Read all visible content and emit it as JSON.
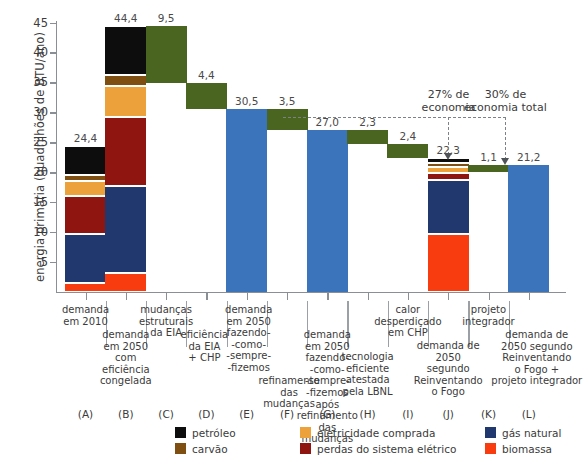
{
  "chart_data": {
    "type": "bar",
    "title": "",
    "xlabel": "",
    "ylabel": "energia primária (quadrilhões de BTU/ano)",
    "ylim": [
      0,
      45
    ],
    "yticks": [
      5,
      10,
      15,
      20,
      25,
      30,
      35,
      40,
      45
    ],
    "grid": false,
    "legend_position": "bottom",
    "waterfall": true,
    "categories": [
      "demanda\nem 2010",
      "demanda\nem 2050\ncom\neficiência\ncongelada",
      "mudanças\nestruturais\nda EIA",
      "eficiência\nda EIA\n+ CHP",
      "demanda\nem 2050\nfazendo-\n-como-\n-sempre-\n-fizemos",
      "refinamento\ndas\nmudanças",
      "demanda\nem 2050\nfazendo-\n-como-\n-sempre-\n-fizemos\napós\nrefinamento\ndas\nmudanças",
      "tecnologia\neficiente\natestada\npela LBNL",
      "calor\ndesperdiçado\nem CHP",
      "demanda de\n2050\nsegundo\nReinventando\no Fogo",
      "projeto\nintegrador",
      "demanda de\n2050 segundo\nReinventando\no Fogo +\nprojeto integrador"
    ],
    "category_letters": [
      "(A)",
      "(B)",
      "(C)",
      "(D)",
      "(E)",
      "(F)",
      "(G)",
      "(H)",
      "(I)",
      "(J)",
      "(K)",
      "(L)"
    ],
    "values": [
      24.4,
      44.4,
      9.5,
      4.4,
      30.5,
      3.5,
      27.0,
      2.3,
      2.4,
      22.3,
      1.1,
      21.2
    ],
    "value_labels": [
      "24,4",
      "44,4",
      "9,5",
      "4,4",
      "30,5",
      "3,5",
      "27,0",
      "2,3",
      "2,4",
      "22,3",
      "1,1",
      "21,2"
    ],
    "bar_kinds": [
      "stacked",
      "stacked",
      "decrement",
      "decrement",
      "total",
      "decrement",
      "total",
      "decrement",
      "decrement",
      "stacked",
      "decrement",
      "total"
    ],
    "series": [
      {
        "name": "biomassa",
        "key": "biomassa",
        "color": "#f93c10",
        "values": [
          1.5,
          3.1,
          null,
          null,
          null,
          null,
          null,
          null,
          null,
          9.7,
          null,
          null
        ]
      },
      {
        "name": "gás natural",
        "key": "gas",
        "color": "#21386e",
        "values": [
          8.1,
          14.6,
          null,
          null,
          null,
          null,
          null,
          null,
          null,
          9.0,
          null,
          null
        ]
      },
      {
        "name": "perdas do sistema elétrico",
        "key": "perdas",
        "color": "#8e1510",
        "values": [
          6.5,
          11.5,
          null,
          null,
          null,
          null,
          null,
          null,
          null,
          1.1,
          null,
          null
        ]
      },
      {
        "name": "eletricidade comprada",
        "key": "eletrica",
        "color": "#eda13a",
        "values": [
          2.4,
          5.2,
          null,
          null,
          null,
          null,
          null,
          null,
          null,
          1.0,
          null,
          null
        ]
      },
      {
        "name": "carvão",
        "key": "carvao",
        "color": "#7e4f11",
        "values": [
          1.0,
          1.9,
          null,
          null,
          null,
          null,
          null,
          null,
          null,
          0.7,
          null,
          null
        ]
      },
      {
        "name": "petróleo",
        "key": "petroleo",
        "color": "#0d0d0d",
        "values": [
          4.9,
          8.1,
          null,
          null,
          null,
          null,
          null,
          null,
          null,
          0.8,
          null,
          null
        ]
      }
    ],
    "bar_colors": {
      "decrement": "#4a6520",
      "total": "#3b74bb"
    },
    "waterfall_bases": [
      0,
      0,
      34.9,
      30.5,
      0,
      27.0,
      0,
      24.7,
      22.3,
      0,
      20.1,
      0
    ],
    "annotations": [
      {
        "id": "economia-27",
        "text": "27% de\neconomia",
        "target_letter": "(J)"
      },
      {
        "id": "economia-30",
        "text": "30% de\neconomia total",
        "target_letter": "(L)"
      }
    ],
    "legend": {
      "columns": [
        [
          {
            "label": "petróleo",
            "color": "#0d0d0d"
          },
          {
            "label": "carvão",
            "color": "#7e4f11"
          }
        ],
        [
          {
            "label": "eletricidade comprada",
            "color": "#eda13a"
          },
          {
            "label": "perdas do sistema elétrico",
            "color": "#8e1510"
          }
        ],
        [
          {
            "label": "gás natural",
            "color": "#21386e"
          },
          {
            "label": "biomassa",
            "color": "#f93c10"
          }
        ]
      ]
    }
  }
}
